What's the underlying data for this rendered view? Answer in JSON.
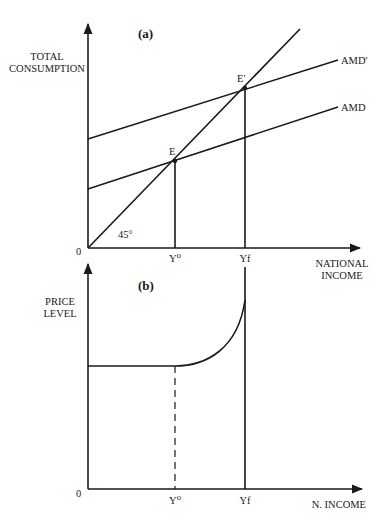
{
  "running_head": "",
  "panel_a": {
    "label": "(a)",
    "y_axis_label_line1": "TOTAL",
    "y_axis_label_line2": "CONSUMPTION",
    "x_axis_label_line1": "NATIONAL",
    "x_axis_label_line2": "INCOME",
    "origin_label": "0",
    "angle_label": "45°",
    "point_E": "E",
    "point_E_prime": "E′",
    "curve_AMD_prime": "AMD′",
    "curve_AMD": "AMD",
    "tick_Y0": "Y⁰",
    "tick_Yf": "Yf"
  },
  "panel_b": {
    "label": "(b)",
    "y_axis_label_line1": "PRICE",
    "y_axis_label_line2": "LEVEL",
    "x_axis_label": "N. INCOME",
    "origin_label": "0",
    "tick_Y0": "Y⁰",
    "tick_Yf": "Yf"
  },
  "colors": {
    "ink": "#1a1a1a",
    "background": "#ffffff"
  }
}
